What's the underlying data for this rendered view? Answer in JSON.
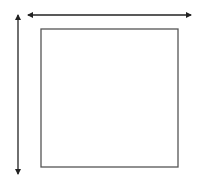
{
  "diagram": {
    "colors": {
      "background": "#ffffff",
      "square_stroke": "#555555",
      "arrow_stroke": "#222222"
    },
    "square": {
      "x": 41,
      "y": 29,
      "width": 137,
      "height": 138
    },
    "width_arrow": {
      "x1": 28,
      "y1": 15,
      "x2": 191,
      "y2": 15,
      "heads": "both"
    },
    "height_arrow": {
      "x1": 18,
      "y1": 15,
      "x2": 18,
      "y2": 174,
      "heads": "both"
    }
  }
}
